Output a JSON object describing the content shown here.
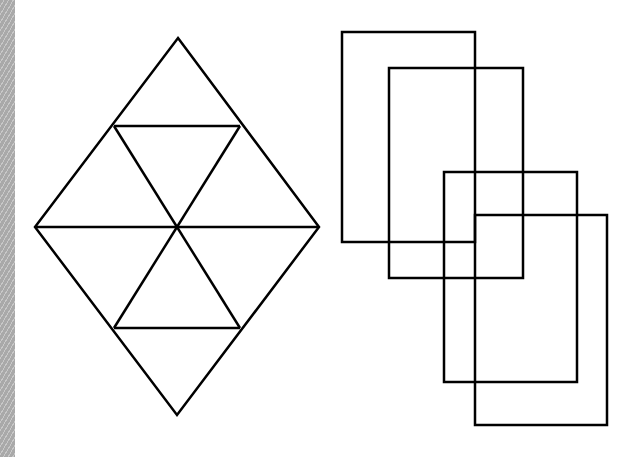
{
  "canvas": {
    "width": 631,
    "height": 457,
    "background": "#ffffff",
    "stroke": "#000000",
    "stroke_width": 2.5
  },
  "left_strip": {
    "color": "#a9a9a9",
    "width": 15
  },
  "figures": {
    "diamond": {
      "type": "rhombus-subdivided",
      "vertices": {
        "top": [
          178,
          38
        ],
        "left": [
          35,
          227
        ],
        "right": [
          319,
          227
        ],
        "bottom": [
          177,
          415
        ]
      },
      "center": [
        177,
        227
      ],
      "upper_bar": {
        "y": 126,
        "x1": 114,
        "x2": 240
      },
      "lower_bar": {
        "y": 328,
        "x1": 114,
        "x2": 240
      }
    },
    "rectangles": [
      {
        "x": 342,
        "y": 32,
        "w": 133,
        "h": 210
      },
      {
        "x": 389,
        "y": 68,
        "w": 134,
        "h": 210
      },
      {
        "x": 444,
        "y": 172,
        "w": 133,
        "h": 210
      },
      {
        "x": 475,
        "y": 215,
        "w": 132,
        "h": 210
      }
    ]
  }
}
